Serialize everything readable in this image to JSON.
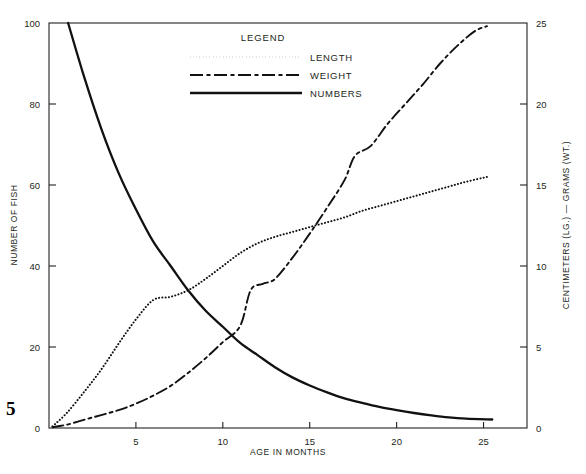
{
  "page": {
    "number": "5"
  },
  "legend": {
    "title": "LEGEND",
    "items": [
      {
        "label": "LENGTH",
        "style": "dotted"
      },
      {
        "label": "WEIGHT",
        "style": "dash-dot"
      },
      {
        "label": "NUMBERS",
        "style": "solid"
      }
    ]
  },
  "axes": {
    "x": {
      "label": "AGE IN MONTHS",
      "ticks": [
        "5",
        "10",
        "15",
        "20",
        "25"
      ]
    },
    "y_left": {
      "label": "NUMBER OF FISH",
      "ticks": [
        "0",
        "20",
        "40",
        "60",
        "80",
        "100"
      ]
    },
    "y_right": {
      "label": "CENTIMETERS (LG.) — GRAMS (WT.)",
      "ticks": [
        "0",
        "5",
        "10",
        "15",
        "20",
        "25"
      ]
    }
  },
  "chart_data": {
    "type": "line",
    "title": "",
    "xlabel": "AGE IN MONTHS",
    "ylabel": "NUMBER OF FISH",
    "y2label": "CENTIMETERS (LG.) — GRAMS (WT.)",
    "xlim": [
      0,
      27.5
    ],
    "ylim": [
      0,
      100
    ],
    "y2lim": [
      0,
      25
    ],
    "grid": false,
    "legend_position": "top-center",
    "xticks": [
      5,
      10,
      15,
      20,
      25
    ],
    "yticks": [
      0,
      20,
      40,
      60,
      80,
      100
    ],
    "y2ticks": [
      0,
      5,
      10,
      15,
      20,
      25
    ],
    "series": [
      {
        "name": "LENGTH",
        "axis": "right",
        "units": "centimeters",
        "linestyle": "dotted",
        "x": [
          0.2,
          1,
          2,
          3,
          4,
          5,
          6,
          7,
          8,
          9,
          10,
          11,
          12,
          13,
          14,
          15,
          16,
          17,
          18,
          19,
          20,
          21,
          22,
          23,
          24,
          25.2
        ],
        "y": [
          0.1,
          0.9,
          2.2,
          3.6,
          5.2,
          6.7,
          7.9,
          8.1,
          8.5,
          9.2,
          10.0,
          10.8,
          11.4,
          11.8,
          12.1,
          12.4,
          12.7,
          13.0,
          13.4,
          13.7,
          14.0,
          14.3,
          14.6,
          14.9,
          15.2,
          15.5
        ]
      },
      {
        "name": "WEIGHT",
        "axis": "right",
        "units": "grams",
        "linestyle": "dash-dot",
        "x": [
          0.2,
          1,
          2,
          3,
          4,
          5,
          6,
          7,
          8,
          9,
          10,
          11,
          11.6,
          12.3,
          13,
          14,
          15,
          16,
          17,
          17.6,
          18.5,
          19.5,
          20.5,
          21.5,
          22.5,
          23.5,
          24.5,
          25.2
        ],
        "y": [
          0.05,
          0.2,
          0.5,
          0.8,
          1.1,
          1.5,
          2.0,
          2.6,
          3.4,
          4.3,
          5.3,
          6.3,
          8.5,
          8.9,
          9.2,
          10.5,
          12.0,
          13.6,
          15.3,
          16.8,
          17.4,
          18.8,
          20.0,
          21.2,
          22.5,
          23.6,
          24.5,
          24.8
        ]
      },
      {
        "name": "NUMBERS",
        "axis": "left",
        "units": "fish",
        "linestyle": "solid",
        "x": [
          1.1,
          2,
          3,
          4,
          5,
          6,
          7,
          8,
          9,
          10,
          11,
          12,
          13,
          14,
          15,
          16,
          17,
          18,
          19,
          20,
          21,
          22,
          23,
          24,
          25.5
        ],
        "y": [
          100,
          87,
          74,
          63,
          54,
          46,
          40,
          34,
          29,
          25,
          21,
          18,
          15,
          12.5,
          10.5,
          8.8,
          7.3,
          6.2,
          5.2,
          4.4,
          3.7,
          3.1,
          2.6,
          2.3,
          2.1
        ]
      }
    ]
  }
}
